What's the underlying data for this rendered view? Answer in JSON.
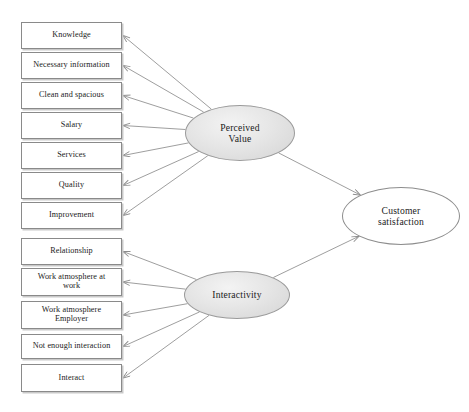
{
  "diagram": {
    "type": "structural-equation-path-diagram",
    "canvas": {
      "width": 469,
      "height": 412,
      "background": "#ffffff"
    },
    "colors": {
      "box_border": "#8a8a8a",
      "box_fill": "#ffffff",
      "box_shadow": "#c9c9c9",
      "ellipse_border": "#9a9a9a",
      "ellipse_fill": "#e4e4e4",
      "outcome_fill": "#ffffff",
      "edge": "#8c8c8c",
      "text": "#1b1b1b"
    },
    "indicators": [
      {
        "id": "knowledge",
        "label": "Knowledge",
        "x": 21,
        "y": 22,
        "w": 101,
        "h": 27,
        "parent": "perceived_value"
      },
      {
        "id": "necessary_information",
        "label": "Necessary information",
        "x": 21,
        "y": 52,
        "w": 101,
        "h": 27,
        "parent": "perceived_value"
      },
      {
        "id": "clean_and_spacious",
        "label": "Clean and spacious",
        "x": 21,
        "y": 82,
        "w": 101,
        "h": 27,
        "parent": "perceived_value"
      },
      {
        "id": "salary",
        "label": "Salary",
        "x": 21,
        "y": 112,
        "w": 101,
        "h": 27,
        "parent": "perceived_value"
      },
      {
        "id": "services",
        "label": "Services",
        "x": 21,
        "y": 142,
        "w": 101,
        "h": 27,
        "parent": "perceived_value"
      },
      {
        "id": "quality",
        "label": "Quality",
        "x": 21,
        "y": 172,
        "w": 101,
        "h": 27,
        "parent": "perceived_value"
      },
      {
        "id": "improvement",
        "label": "Improvement",
        "x": 21,
        "y": 202,
        "w": 101,
        "h": 27,
        "parent": "perceived_value"
      },
      {
        "id": "relationship",
        "label": "Relationship",
        "x": 21,
        "y": 238,
        "w": 101,
        "h": 27,
        "parent": "interactivity"
      },
      {
        "id": "work_atmosphere_at_work",
        "label": "Work atmosphere at\nwork",
        "x": 21,
        "y": 268,
        "w": 101,
        "h": 28,
        "parent": "interactivity"
      },
      {
        "id": "work_atmosphere_employer",
        "label": "Work atmosphere\nEmployer",
        "x": 21,
        "y": 301,
        "w": 101,
        "h": 28,
        "parent": "interactivity"
      },
      {
        "id": "not_enough_interaction",
        "label": "Not enough interaction",
        "x": 21,
        "y": 334,
        "w": 101,
        "h": 25,
        "parent": "interactivity"
      },
      {
        "id": "interact",
        "label": "Interact",
        "x": 21,
        "y": 364,
        "w": 101,
        "h": 28,
        "parent": "interactivity"
      }
    ],
    "latents": [
      {
        "id": "perceived_value",
        "label": "Perceived\nValue",
        "cx": 240,
        "cy": 133,
        "rx": 55,
        "ry": 28,
        "style": "filled"
      },
      {
        "id": "interactivity",
        "label": "Interactivity",
        "cx": 237,
        "cy": 295,
        "rx": 53,
        "ry": 24,
        "style": "filled"
      },
      {
        "id": "customer_satisfaction",
        "label": "Customer\nsatisfaction",
        "cx": 401,
        "cy": 216,
        "rx": 59,
        "ry": 29,
        "style": "hollow"
      }
    ],
    "paths": [
      {
        "from": "perceived_value",
        "to": "knowledge"
      },
      {
        "from": "perceived_value",
        "to": "necessary_information"
      },
      {
        "from": "perceived_value",
        "to": "clean_and_spacious"
      },
      {
        "from": "perceived_value",
        "to": "salary"
      },
      {
        "from": "perceived_value",
        "to": "services"
      },
      {
        "from": "perceived_value",
        "to": "quality"
      },
      {
        "from": "perceived_value",
        "to": "improvement"
      },
      {
        "from": "interactivity",
        "to": "relationship"
      },
      {
        "from": "interactivity",
        "to": "work_atmosphere_at_work"
      },
      {
        "from": "interactivity",
        "to": "work_atmosphere_employer"
      },
      {
        "from": "interactivity",
        "to": "not_enough_interaction"
      },
      {
        "from": "interactivity",
        "to": "interact"
      },
      {
        "from": "perceived_value",
        "to": "customer_satisfaction"
      },
      {
        "from": "interactivity",
        "to": "customer_satisfaction"
      }
    ]
  }
}
